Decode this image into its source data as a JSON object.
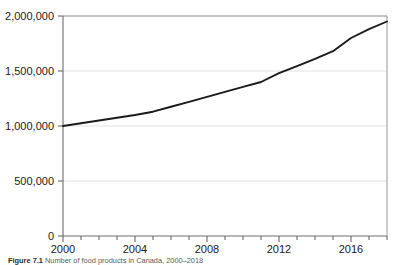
{
  "figure": {
    "caption_label": "Figure 7.1",
    "caption_text": "Number of food products in Canada, 2000–2018"
  },
  "chart_data": {
    "type": "line",
    "title": "",
    "xlabel": "",
    "ylabel": "",
    "xlim": [
      2000,
      2018
    ],
    "ylim": [
      0,
      2000000
    ],
    "grid": true,
    "legend": "none",
    "y_ticks": [
      0,
      500000,
      1000000,
      1500000,
      2000000
    ],
    "y_tick_labels": [
      "0",
      "500,000",
      "1,000,000",
      "1,500,000",
      "2,000,000"
    ],
    "x_ticks": [
      2000,
      2001,
      2002,
      2003,
      2004,
      2005,
      2006,
      2007,
      2008,
      2009,
      2010,
      2011,
      2012,
      2013,
      2014,
      2015,
      2016,
      2017,
      2018
    ],
    "x_tick_labels": [
      "2000",
      "",
      "",
      "",
      "2004",
      "",
      "",
      "",
      "2008",
      "",
      "",
      "",
      "2012",
      "",
      "",
      "",
      "2016",
      "",
      ""
    ],
    "x_labeled_ticks": [
      2000,
      2004,
      2008,
      2012,
      2016
    ],
    "line_color": "#1a1a1a",
    "series": [
      {
        "name": "Number of food products",
        "x": [
          2000,
          2001,
          2002,
          2003,
          2004,
          2005,
          2006,
          2007,
          2008,
          2009,
          2010,
          2011,
          2012,
          2013,
          2014,
          2015,
          2016,
          2017,
          2018
        ],
        "values": [
          1000000,
          1025000,
          1050000,
          1075000,
          1100000,
          1130000,
          1175000,
          1220000,
          1265000,
          1310000,
          1355000,
          1400000,
          1480000,
          1545000,
          1610000,
          1680000,
          1800000,
          1880000,
          1950000
        ]
      }
    ]
  }
}
